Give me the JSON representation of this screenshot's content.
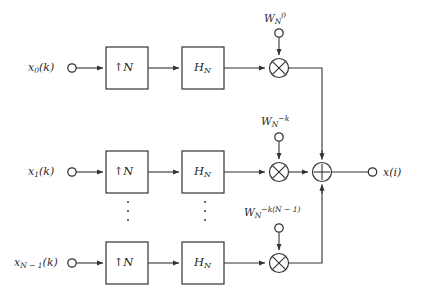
{
  "figure": {
    "type": "block-diagram",
    "domain": "signal-processing",
    "background_color": "#ffffff",
    "line_color": "#333333",
    "text_color": "#2b2b2b"
  },
  "branches": [
    {
      "id": "branch-0",
      "input_label_base": "x",
      "input_label_sub": "0",
      "input_label_tail": "(k)",
      "upsampler": {
        "arrow": "↑",
        "factor": "N"
      },
      "filter": {
        "base": "H",
        "sub": "N"
      },
      "modulator": {
        "symbol": "×"
      },
      "twiddle": {
        "base": "W",
        "sub": "N",
        "sup": "0"
      }
    },
    {
      "id": "branch-1",
      "input_label_base": "x",
      "input_label_sub": "1",
      "input_label_tail": "(k)",
      "upsampler": {
        "arrow": "↑",
        "factor": "N"
      },
      "filter": {
        "base": "H",
        "sub": "N"
      },
      "modulator": {
        "symbol": "×"
      },
      "twiddle": {
        "base": "W",
        "sub": "N",
        "sup": "−k"
      }
    },
    {
      "id": "branch-n-1",
      "input_label_base": "x",
      "input_label_sub": "N − 1",
      "input_label_tail": "(k)",
      "upsampler": {
        "arrow": "↑",
        "factor": "N"
      },
      "filter": {
        "base": "H",
        "sub": "N"
      },
      "modulator": {
        "symbol": "×"
      },
      "twiddle": {
        "base": "W",
        "sub": "N",
        "sup": "−k(N − 1)"
      }
    }
  ],
  "adder": {
    "symbol": "+"
  },
  "output": {
    "label_base": "x",
    "label_tail": "(i)"
  },
  "ellipsis": {
    "count": 3,
    "positions": [
      "upsampler-column",
      "filter-column"
    ]
  }
}
